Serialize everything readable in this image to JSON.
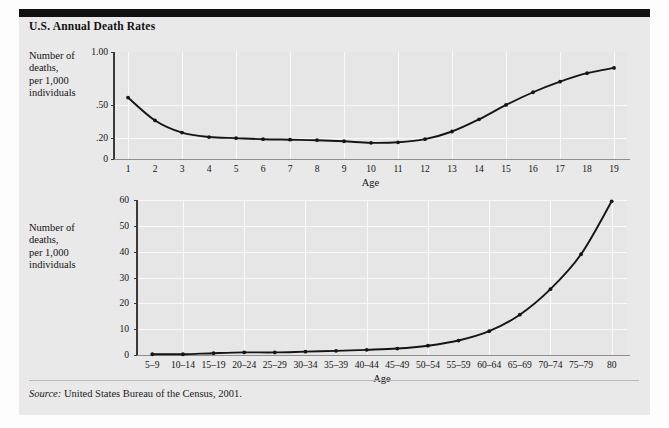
{
  "figure": {
    "title": "U.S. Annual Death Rates",
    "source": "Source: United States Bureau of the Census, 2001.",
    "source_prefix": "Source:",
    "source_rest": " United States Bureau of the Census, 2001.",
    "panel_color": "#e9e9e9",
    "ink_color": "#151515",
    "grid_color": "#fafafa"
  },
  "chart_data": [
    {
      "id": "chart-top",
      "type": "line",
      "title": "U.S. Annual Death Rates",
      "xlabel": "Age",
      "ylabel": "Number of deaths, per 1,000 individuals",
      "ylabel_lines": [
        "Number of",
        "deaths,",
        "per 1,000",
        "individuals"
      ],
      "categories": [
        "1",
        "2",
        "3",
        "4",
        "5",
        "6",
        "7",
        "8",
        "9",
        "10",
        "11",
        "12",
        "13",
        "14",
        "15",
        "16",
        "17",
        "18",
        "19"
      ],
      "x": [
        1,
        2,
        3,
        4,
        5,
        6,
        7,
        8,
        9,
        10,
        11,
        12,
        13,
        14,
        15,
        16,
        17,
        18,
        19
      ],
      "values": [
        0.57,
        0.36,
        0.25,
        0.21,
        0.2,
        0.19,
        0.185,
        0.18,
        0.17,
        0.155,
        0.16,
        0.19,
        0.26,
        0.37,
        0.5,
        0.62,
        0.72,
        0.8,
        0.85
      ],
      "ytick_labels": [
        "1.00",
        ".50",
        ".20",
        "0"
      ],
      "ytick_values": [
        1.0,
        0.5,
        0.2,
        0
      ],
      "ytick_frac": [
        1.0,
        0.505,
        0.195,
        0
      ],
      "ylim": [
        0,
        1.0
      ],
      "grid": true,
      "grid_y_at": [
        ".50",
        ".20"
      ],
      "legend": "none"
    },
    {
      "id": "chart-bottom",
      "type": "line",
      "title": "",
      "xlabel": "Age",
      "ylabel": "Number of deaths, per 1,000 individuals",
      "ylabel_lines": [
        "Number of",
        "deaths,",
        "per 1,000",
        "individuals"
      ],
      "categories": [
        "5–9",
        "10–14",
        "15–19",
        "20–24",
        "25–29",
        "30–34",
        "35–39",
        "40–44",
        "45–49",
        "50–54",
        "55–59",
        "60–64",
        "65–69",
        "70–74",
        "75–79",
        "80"
      ],
      "values": [
        0.3,
        0.3,
        0.7,
        1.0,
        1.0,
        1.3,
        1.6,
        2.0,
        2.5,
        3.6,
        5.6,
        9.2,
        15.6,
        25.5,
        39.0,
        59.5
      ],
      "ytick_labels": [
        "60",
        "50",
        "40",
        "30",
        "20",
        "10",
        "0"
      ],
      "ytick_values": [
        60,
        50,
        40,
        30,
        20,
        10,
        0
      ],
      "ylim": [
        0,
        60
      ],
      "grid": true,
      "legend": "none"
    }
  ]
}
